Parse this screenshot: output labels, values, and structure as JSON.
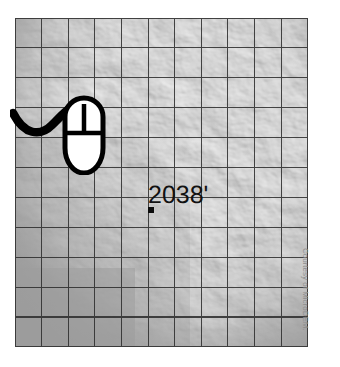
{
  "map": {
    "type": "shaded-relief-hillshade",
    "grid": {
      "columns": 11,
      "rows": 11,
      "cell_size_px": 26.6,
      "line_color": "#2e2e2e"
    },
    "base_color": "#9c9c9c",
    "terrain_light": "#e8e8e8",
    "terrain_dark": "#4a4a4a"
  },
  "callout": {
    "elevation_label": "2038'",
    "marker_name": "elevation-point-marker",
    "text_color": "#111111",
    "marker_color": "#0d0d0d"
  },
  "cursor": {
    "icon_name": "computer-mouse-icon",
    "body_fill": "#ffffff",
    "outline_color": "#000000",
    "cable_color": "#000000"
  },
  "credit": {
    "text": "Courtesy of MicroDEM.",
    "color": "#8d8d8d"
  }
}
